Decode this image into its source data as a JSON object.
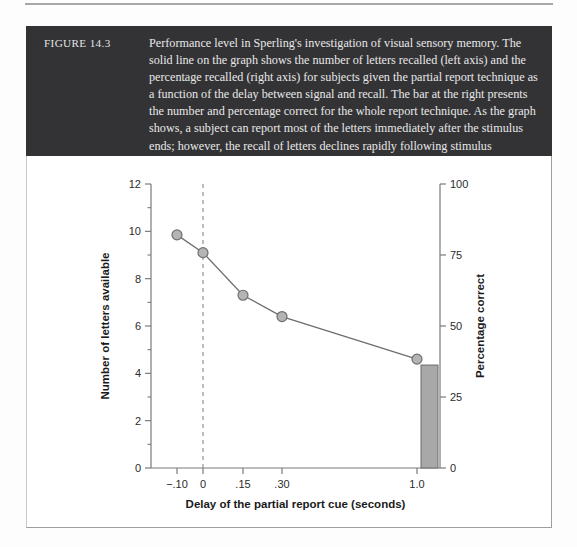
{
  "figure": {
    "label": "FIGURE 14.3",
    "caption": "Performance level in Sperling's investigation of visual sensory memory. The solid line on the graph shows the number of letters recalled (left axis) and the percentage recalled (right axis) for subjects given the partial report technique as a function of the delay between signal and recall. The bar at the right presents the number and percentage correct for the whole report technique. As the graph shows, a subject can report most of the letters immediately after the stimulus ends; however, the recall of letters declines rapidly following stimulus presentation"
  },
  "chart_data": {
    "type": "line",
    "title": "",
    "xlabel": "Delay of the partial report cue (seconds)",
    "ylabel": "Number of letters available",
    "y2label": "Percentage correct",
    "x": [
      -0.1,
      0,
      0.15,
      0.3,
      1.0
    ],
    "x_tick_labels": [
      "−.10",
      "0",
      ".15",
      ".30",
      "1.0"
    ],
    "x_tick_positions": [
      -0.1,
      0,
      0.15,
      0.3,
      1.0
    ],
    "series": [
      {
        "name": "Partial report technique",
        "values": [
          9.85,
          9.1,
          7.3,
          6.4,
          4.6
        ],
        "percent_values": [
          82,
          76,
          61,
          53,
          38
        ],
        "marker": "circle",
        "marker_fill": "#b4b4b4",
        "marker_edge": "#6e6e6e",
        "line_color": "#6e6e6e"
      }
    ],
    "bar": {
      "name": "Whole report technique",
      "x": 1.0,
      "value": 4.35,
      "percent_value": 36,
      "fill": "#a8a8a8",
      "edge": "#6a6a6a"
    },
    "reference_line": {
      "x": 0,
      "style": "dashed",
      "color": "#9a9a9a"
    },
    "ylim": [
      0,
      12
    ],
    "y_ticks": [
      0,
      2,
      4,
      6,
      8,
      10,
      12
    ],
    "y_tick_labels": [
      "0",
      "2",
      "4",
      "6",
      "8",
      "10",
      "12"
    ],
    "y_minor_ticks": [
      1,
      3,
      5,
      7,
      9,
      11
    ],
    "y2lim": [
      0,
      100
    ],
    "y2_ticks": [
      0,
      25,
      50,
      75,
      100
    ],
    "y2_tick_labels": [
      "0",
      "25",
      "50",
      "75",
      "100"
    ],
    "grid": false,
    "legend": "none"
  },
  "colors": {
    "caption_band": "#333335",
    "caption_text": "#e8e8e9",
    "axis": "#7a7a7a",
    "marker": "#b4b4b4",
    "bar": "#a8a8a8"
  }
}
